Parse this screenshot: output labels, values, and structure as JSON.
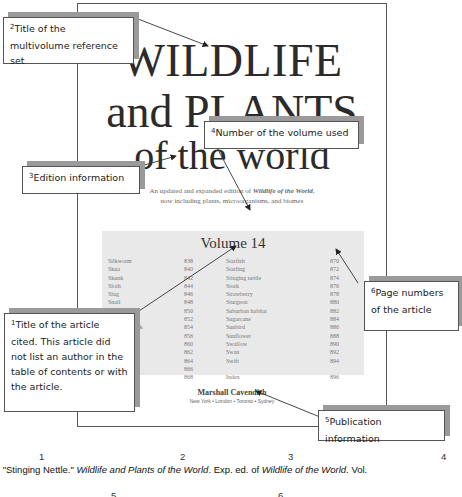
{
  "book_page": {
    "title_lines": [
      "WILDLIFE",
      "and PLANTS",
      "of the world"
    ],
    "subtitle_line1_prefix": "An updated and expanded edition of ",
    "subtitle_line1_italic": "Wildlife of the World",
    "subtitle_line1_suffix": ",",
    "subtitle_line2": "now including plants, microorganisms, and biomes",
    "volume_title": "Volume 14",
    "toc_left": [
      {
        "name": "Silkworm",
        "page": "838"
      },
      {
        "name": "Skua",
        "page": "840"
      },
      {
        "name": "Skunk",
        "page": "842"
      },
      {
        "name": "Sloth",
        "page": "844"
      },
      {
        "name": "Slug",
        "page": "846"
      },
      {
        "name": "Snail",
        "page": "848"
      },
      {
        "name": "Soybean",
        "page": "850"
      },
      {
        "name": "Sparrow",
        "page": "852"
      },
      {
        "name": "Sparrow hawk",
        "page": "854"
      },
      {
        "name": "Spider",
        "page": "856"
      },
      {
        "name": "",
        "page": "860"
      },
      {
        "name": "",
        "page": "862"
      },
      {
        "name": "",
        "page": "864"
      },
      {
        "name": "",
        "page": "866"
      },
      {
        "name": "",
        "page": "868"
      }
    ],
    "toc_right": [
      {
        "name": "Starfish",
        "page": "870"
      },
      {
        "name": "Starling",
        "page": "872"
      },
      {
        "name": "Stinging nettle",
        "page": "874"
      },
      {
        "name": "Stork",
        "page": "876"
      },
      {
        "name": "Strawberry",
        "page": "878"
      },
      {
        "name": "Sturgeon",
        "page": "880"
      },
      {
        "name": "Suburban habitat",
        "page": "882"
      },
      {
        "name": "Sugarcane",
        "page": "884"
      },
      {
        "name": "Sunbird",
        "page": "886"
      },
      {
        "name": "Sunflower",
        "page": "888"
      },
      {
        "name": "Swallow",
        "page": "890"
      },
      {
        "name": "Swan",
        "page": "892"
      },
      {
        "name": "Swift",
        "page": "894"
      },
      {
        "name": "",
        "page": ""
      },
      {
        "name": "Index",
        "page": "896"
      }
    ],
    "publisher": "Marshall Cavendish",
    "cities": "New York • London • Toronto • Sydney"
  },
  "callouts": {
    "c1": {
      "num": "1",
      "text": "Title of the article cited. This article did not list an author in the table of contents or with the article."
    },
    "c2": {
      "num": "2",
      "text": "Title of the multivolume reference set"
    },
    "c3": {
      "num": "3",
      "text": "Edition information"
    },
    "c4": {
      "num": "4",
      "text": "Number of the volume used"
    },
    "c5": {
      "num": "5",
      "text": "Publication information"
    },
    "c6": {
      "num": "6",
      "text": "Page numbers of the article"
    }
  },
  "citation": {
    "part1": "\"Stinging Nettle.\" ",
    "part2": "Wildlife and Plants of the World",
    "part3": ". Exp. ed. of ",
    "part4": "Wildlife of the World",
    "part5": ". Vol.",
    "numbers_top": [
      "1",
      "2",
      "3",
      "4"
    ],
    "numbers_bottom": [
      "5",
      "6"
    ]
  }
}
